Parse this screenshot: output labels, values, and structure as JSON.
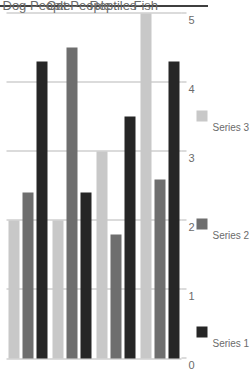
{
  "chart_data": {
    "type": "bar",
    "orientation": "rotated-90",
    "title": "",
    "xlabel": "",
    "ylabel": "",
    "categories": [
      "Dog People",
      "Cat People",
      "Reptiles",
      "Fish"
    ],
    "series": [
      {
        "name": "Series 1",
        "color": "#262626",
        "values": [
          4.3,
          2.4,
          3.5,
          4.3
        ]
      },
      {
        "name": "Series 2",
        "color": "#6e6e6e",
        "values": [
          2.4,
          4.5,
          1.8,
          2.6
        ]
      },
      {
        "name": "Series 3",
        "color": "#c8c8c8",
        "values": [
          2.0,
          2.0,
          3.0,
          5.0
        ]
      }
    ],
    "ticks": [
      "0",
      "1",
      "2",
      "3",
      "4",
      "5"
    ],
    "xlim": [
      0,
      5
    ],
    "grid": true,
    "legend_position": "right"
  },
  "legend": {
    "entries": [
      {
        "label": "Series 1",
        "color": "#262626"
      },
      {
        "label": "Series 2",
        "color": "#6e6e6e"
      },
      {
        "label": "Series 3",
        "color": "#c8c8c8"
      }
    ]
  },
  "axis": {
    "tick_labels": [
      "0",
      "1",
      "2",
      "3",
      "4",
      "5"
    ]
  },
  "categories": {
    "labels": [
      "Dog People",
      "Cat People",
      "Reptiles",
      "Fish"
    ]
  },
  "colors": {
    "series1": "#262626",
    "series2": "#6e6e6e",
    "series3": "#c8c8c8",
    "gridline": "#b8b8b8",
    "text": "#6b6b6b",
    "rule": "#3f3f3f"
  }
}
